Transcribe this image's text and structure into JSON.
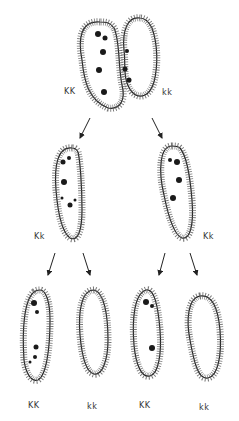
{
  "diagram": {
    "generation_1": {
      "left_cell": {
        "genotype": "KK",
        "has_particles": true
      },
      "right_cell": {
        "genotype": "kk",
        "has_particles": false
      }
    },
    "generation_2": [
      {
        "genotype": "Kk",
        "has_particles": true
      },
      {
        "genotype": "Kk",
        "has_particles": true
      }
    ],
    "generation_3": [
      {
        "genotype": "KK",
        "has_particles": true
      },
      {
        "genotype": "kk",
        "has_particles": false
      },
      {
        "genotype": "KK",
        "has_particles": true
      },
      {
        "genotype": "kk",
        "has_particles": false
      }
    ],
    "labels": {
      "g1_left": "KK",
      "g1_right": "kk",
      "g2_left": "Kk",
      "g2_right": "Kk",
      "g3_1": "KK",
      "g3_2": "kk",
      "g3_3": "KK",
      "g3_4": "kk"
    },
    "colors": {
      "outline": "#222222",
      "cilia": "#444444",
      "particle": "#1a1a1a"
    }
  }
}
